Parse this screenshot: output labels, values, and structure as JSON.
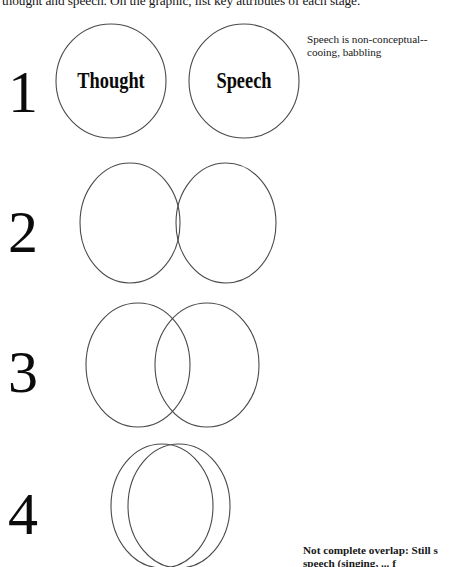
{
  "document": {
    "type": "worksheet-scan",
    "instruction": "thought and speech.  On the graphic, list key attributes of each stage.",
    "background_color": "#ffffff",
    "ink_color": "#111111",
    "outline_color": "#4a4a4a"
  },
  "labels": {
    "thought": "Thought",
    "speech": "Speech"
  },
  "stages": [
    {
      "number": "1",
      "overlap": "none",
      "annotation": {
        "line1": "Speech is non-conceptual--",
        "line2": "cooing, babbling"
      }
    },
    {
      "number": "2",
      "overlap": "slight",
      "annotation": null
    },
    {
      "number": "3",
      "overlap": "partial",
      "annotation": null
    },
    {
      "number": "4",
      "overlap": "near-complete",
      "annotation": {
        "line1": "Not complete overlap:  Still s",
        "line2": "speech (singing, ... f"
      }
    }
  ]
}
